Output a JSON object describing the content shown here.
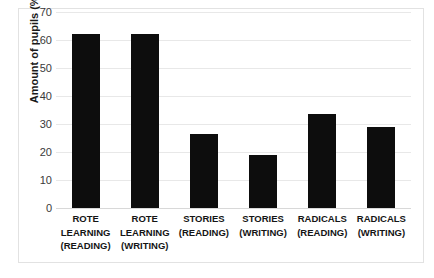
{
  "chart_data": {
    "type": "bar",
    "title": "",
    "xlabel": "",
    "ylabel": "Amount of pupils (%)",
    "categories": [
      "ROTE LEARNING (READING)",
      "ROTE LEARNING (WRITING)",
      "STORIES (READING)",
      "STORIES (WRITING)",
      "RADICALS (READING)",
      "RADICALS (WRITING)"
    ],
    "category_lines": [
      [
        "ROTE",
        "LEARNING",
        "(READING)"
      ],
      [
        "ROTE",
        "LEARNING",
        "(WRITING)"
      ],
      [
        "STORIES",
        "(READING)"
      ],
      [
        "STORIES",
        "(WRITING)"
      ],
      [
        "RADICALS",
        "(READING)"
      ],
      [
        "RADICALS",
        "(WRITING)"
      ]
    ],
    "values": [
      62,
      62,
      26.5,
      19,
      33.5,
      29
    ],
    "ylim": [
      0,
      70
    ],
    "ytick_values": [
      0,
      10,
      20,
      30,
      40,
      50,
      60,
      70
    ],
    "ytick_labels": [
      "0",
      "10",
      "20",
      "30",
      "40",
      "50",
      "60",
      "70"
    ],
    "grid": true,
    "legend": "none",
    "bar_color": "#0d0d0d",
    "gridline_color": "#e8e8e8",
    "frame_color": "#e2e2e2"
  }
}
